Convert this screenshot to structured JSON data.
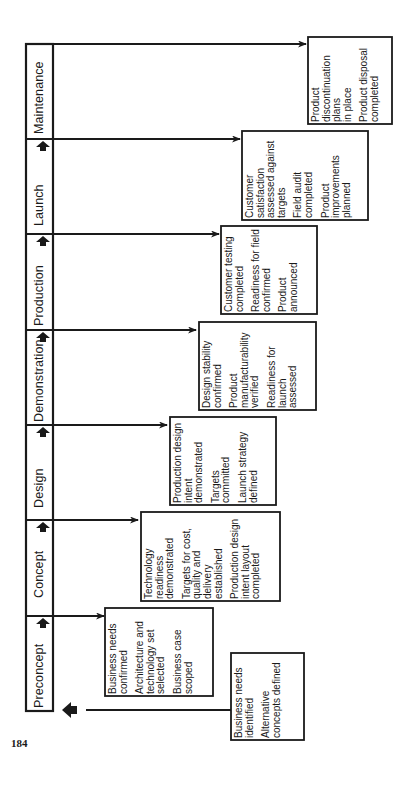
{
  "page_number": "184",
  "stages": [
    {
      "label": "Preconcept"
    },
    {
      "label": "Concept"
    },
    {
      "label": "Design"
    },
    {
      "label": "Demonstration"
    },
    {
      "label": "Production"
    },
    {
      "label": "Launch"
    },
    {
      "label": "Maintenance"
    }
  ],
  "boxes": {
    "pre_entry": {
      "items": [
        "Business needs\nidentified",
        "Alternative\nconcepts defined"
      ]
    },
    "preconcept": {
      "items": [
        "Business needs\nconfirmed",
        "Architecture and\ntechnology set\nselected",
        "Business case\nscoped"
      ]
    },
    "concept": {
      "items": [
        "Technology\nreadiness\ndemonstrated",
        "Targets for cost,\nquality and\ndelivery\nestablished",
        "Production design\nintent layout\ncompleted"
      ]
    },
    "design": {
      "items": [
        "Production design\nintent\ndemonstrated",
        "Targets\ncommitted",
        "Launch strategy\ndefined"
      ]
    },
    "demonstration": {
      "items": [
        "Design stability\nconfirmed",
        "Product\nmanufacturability\nverified",
        "Readiness for\nlaunch\nassessed"
      ]
    },
    "production": {
      "items": [
        "Customer testing\ncompleted",
        "Readiness for field\nconfirmed",
        "Product\nannounced"
      ]
    },
    "launch": {
      "items": [
        "Customer\nsatisfaction\nassessed against\ntargets",
        "Field audit\ncompleted",
        "Product\nimprovements\nplanned"
      ]
    },
    "maintenance": {
      "items": [
        "Product\ndiscontinuation\nplans\nin place",
        "Product disposal\ncompleted"
      ]
    }
  },
  "colors": {
    "line": "#1a1a1a",
    "background": "#ffffff"
  }
}
